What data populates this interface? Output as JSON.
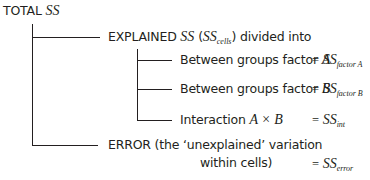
{
  "diagram": {
    "root": {
      "label": "TOTAL",
      "symbol": "SS"
    },
    "explained": {
      "label": "EXPLAINED",
      "symbol": "SS",
      "paren_open": "(",
      "paren_symbol": "SS",
      "paren_sub": "cells",
      "paren_close": ")",
      "suffix": "divided into",
      "children": [
        {
          "label": "Between groups factor",
          "var": "A",
          "eq": "=",
          "symbol": "SS",
          "sub": "factor A"
        },
        {
          "label": "Between groups factor",
          "var": "B",
          "eq": "=",
          "symbol": "SS",
          "sub": "factor B"
        },
        {
          "label": "Interaction",
          "var": "A × B",
          "eq": "=",
          "symbol": "SS",
          "sub": "int"
        }
      ]
    },
    "error": {
      "line1": "ERROR (the ‘unexplained’ variation",
      "line2": "within cells)",
      "eq": "=",
      "symbol": "SS",
      "sub": "error"
    }
  }
}
